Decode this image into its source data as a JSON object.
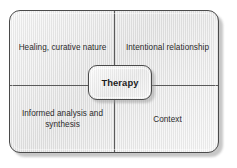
{
  "diagram": {
    "center": {
      "label": "Therapy"
    },
    "quadrants": [
      {
        "position": "top-left",
        "label": "Healing, curative nature"
      },
      {
        "position": "top-right",
        "label": "Intentional relationship"
      },
      {
        "position": "bottom-left",
        "label": "Informed analysis and synthesis"
      },
      {
        "position": "bottom-right",
        "label": "Context"
      }
    ],
    "colors": {
      "frame_border": "#4a4a4a",
      "divider": "#5a5a5a",
      "text": "#2b2b2b",
      "center_text": "#1d1d1d",
      "background": "#ffffff",
      "fill_light": "#f4f4f4",
      "fill_dark": "#dcdcdc"
    }
  }
}
